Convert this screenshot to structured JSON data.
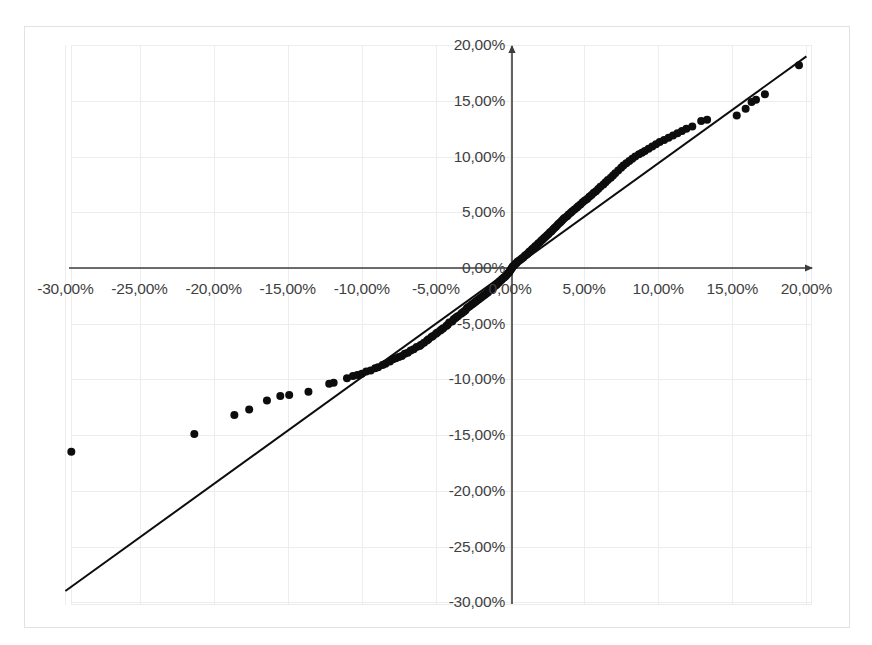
{
  "chart_data": {
    "type": "scatter",
    "title": "",
    "subtitle": "",
    "xlabel": "",
    "ylabel": "",
    "xlim": [
      -30,
      20
    ],
    "ylim": [
      -30,
      20
    ],
    "grid": true,
    "legend": null,
    "decimal_separator": ",",
    "x_tick_labels": [
      "-30,00%",
      "-25,00%",
      "-20,00%",
      "-15,00%",
      "-10,00%",
      "-5,00%",
      "0,00%",
      "5,00%",
      "10,00%",
      "15,00%",
      "20,00%"
    ],
    "x_tick_values": [
      -30,
      -25,
      -20,
      -15,
      -10,
      -5,
      0,
      5,
      10,
      15,
      20
    ],
    "y_tick_labels": [
      "20,00%",
      "15,00%",
      "10,00%",
      "5,00%",
      "0,00%",
      "-5,00%",
      "-10,00%",
      "-15,00%",
      "-20,00%",
      "-25,00%",
      "-30,00%"
    ],
    "y_tick_values": [
      20,
      15,
      10,
      5,
      0,
      -5,
      -10,
      -15,
      -20,
      -25,
      -30
    ],
    "series": [
      {
        "name": "quantile-points",
        "type": "scatter",
        "marker": "filled-circle",
        "color": "#0d0d0d",
        "marker_size": 8,
        "points": [
          [
            -29.6,
            -16.5
          ],
          [
            -21.3,
            -14.9
          ],
          [
            -18.6,
            -13.2
          ],
          [
            -17.6,
            -12.7
          ],
          [
            -16.4,
            -11.9
          ],
          [
            -15.5,
            -11.5
          ],
          [
            -14.9,
            -11.4
          ],
          [
            -13.6,
            -11.1
          ],
          [
            -12.2,
            -10.4
          ],
          [
            -11.9,
            -10.3
          ],
          [
            -11.0,
            -9.9
          ],
          [
            -10.6,
            -9.7
          ],
          [
            -10.3,
            -9.6
          ],
          [
            -10.0,
            -9.5
          ],
          [
            -9.7,
            -9.3
          ],
          [
            -9.4,
            -9.2
          ],
          [
            -9.1,
            -9.0
          ],
          [
            -8.9,
            -8.9
          ],
          [
            -8.6,
            -8.7
          ],
          [
            -8.4,
            -8.6
          ],
          [
            -8.1,
            -8.4
          ],
          [
            -7.9,
            -8.2
          ],
          [
            -7.7,
            -8.1
          ],
          [
            -7.5,
            -8.0
          ],
          [
            -7.3,
            -7.9
          ],
          [
            -7.1,
            -7.7
          ],
          [
            -6.9,
            -7.6
          ],
          [
            -6.7,
            -7.4
          ],
          [
            -6.5,
            -7.3
          ],
          [
            -6.3,
            -7.1
          ],
          [
            -6.1,
            -7.0
          ],
          [
            -6.0,
            -6.9
          ],
          [
            -5.8,
            -6.7
          ],
          [
            -5.6,
            -6.5
          ],
          [
            -5.5,
            -6.4
          ],
          [
            -5.3,
            -6.2
          ],
          [
            -5.2,
            -6.1
          ],
          [
            -5.0,
            -5.9
          ],
          [
            -4.9,
            -5.8
          ],
          [
            -4.7,
            -5.6
          ],
          [
            -4.6,
            -5.5
          ],
          [
            -4.5,
            -5.4
          ],
          [
            -4.3,
            -5.2
          ],
          [
            -4.2,
            -5.1
          ],
          [
            -4.1,
            -4.9
          ],
          [
            -3.9,
            -4.8
          ],
          [
            -3.8,
            -4.6
          ],
          [
            -3.7,
            -4.5
          ],
          [
            -3.6,
            -4.4
          ],
          [
            -3.5,
            -4.3
          ],
          [
            -3.3,
            -4.1
          ],
          [
            -3.2,
            -4.0
          ],
          [
            -3.1,
            -3.9
          ],
          [
            -3.0,
            -3.8
          ],
          [
            -2.9,
            -3.6
          ],
          [
            -2.8,
            -3.5
          ],
          [
            -2.7,
            -3.4
          ],
          [
            -2.6,
            -3.3
          ],
          [
            -2.5,
            -3.2
          ],
          [
            -2.4,
            -3.1
          ],
          [
            -2.3,
            -3.0
          ],
          [
            -2.2,
            -2.9
          ],
          [
            -2.1,
            -2.8
          ],
          [
            -2.0,
            -2.7
          ],
          [
            -1.9,
            -2.6
          ],
          [
            -1.8,
            -2.5
          ],
          [
            -1.7,
            -2.4
          ],
          [
            -1.6,
            -2.3
          ],
          [
            -1.5,
            -2.2
          ],
          [
            -1.45,
            -2.1
          ],
          [
            -1.35,
            -2.0
          ],
          [
            -1.25,
            -1.9
          ],
          [
            -1.15,
            -1.8
          ],
          [
            -1.1,
            -1.7
          ],
          [
            -1.0,
            -1.6
          ],
          [
            -0.9,
            -1.5
          ],
          [
            -0.85,
            -1.4
          ],
          [
            -0.75,
            -1.3
          ],
          [
            -0.7,
            -1.2
          ],
          [
            -0.6,
            -1.1
          ],
          [
            -0.55,
            -1.0
          ],
          [
            -0.45,
            -0.9
          ],
          [
            -0.4,
            -0.85
          ],
          [
            -0.3,
            -0.75
          ],
          [
            -0.25,
            -0.65
          ],
          [
            -0.2,
            -0.55
          ],
          [
            -0.1,
            -0.45
          ],
          [
            -0.05,
            -0.35
          ],
          [
            0.0,
            -0.25
          ],
          [
            0.05,
            -0.15
          ],
          [
            0.1,
            -0.05
          ],
          [
            0.15,
            0.05
          ],
          [
            0.2,
            0.15
          ],
          [
            0.3,
            0.25
          ],
          [
            0.35,
            0.35
          ],
          [
            0.45,
            0.45
          ],
          [
            0.5,
            0.55
          ],
          [
            0.6,
            0.65
          ],
          [
            0.7,
            0.75
          ],
          [
            0.8,
            0.85
          ],
          [
            0.9,
            0.95
          ],
          [
            1.0,
            1.1
          ],
          [
            1.1,
            1.2
          ],
          [
            1.2,
            1.3
          ],
          [
            1.3,
            1.45
          ],
          [
            1.4,
            1.55
          ],
          [
            1.5,
            1.7
          ],
          [
            1.6,
            1.8
          ],
          [
            1.7,
            1.95
          ],
          [
            1.8,
            2.05
          ],
          [
            1.9,
            2.2
          ],
          [
            2.0,
            2.3
          ],
          [
            2.1,
            2.45
          ],
          [
            2.2,
            2.55
          ],
          [
            2.3,
            2.7
          ],
          [
            2.4,
            2.8
          ],
          [
            2.5,
            2.95
          ],
          [
            2.6,
            3.05
          ],
          [
            2.7,
            3.2
          ],
          [
            2.8,
            3.3
          ],
          [
            2.9,
            3.45
          ],
          [
            3.0,
            3.6
          ],
          [
            3.1,
            3.7
          ],
          [
            3.2,
            3.85
          ],
          [
            3.3,
            4.0
          ],
          [
            3.4,
            4.1
          ],
          [
            3.5,
            4.25
          ],
          [
            3.6,
            4.4
          ],
          [
            3.7,
            4.5
          ],
          [
            3.85,
            4.65
          ],
          [
            3.95,
            4.8
          ],
          [
            4.1,
            4.95
          ],
          [
            4.2,
            5.1
          ],
          [
            4.35,
            5.25
          ],
          [
            4.5,
            5.4
          ],
          [
            4.6,
            5.55
          ],
          [
            4.75,
            5.7
          ],
          [
            4.9,
            5.9
          ],
          [
            5.05,
            6.05
          ],
          [
            5.2,
            6.2
          ],
          [
            5.35,
            6.4
          ],
          [
            5.5,
            6.55
          ],
          [
            5.65,
            6.75
          ],
          [
            5.8,
            6.9
          ],
          [
            5.95,
            7.1
          ],
          [
            6.1,
            7.3
          ],
          [
            6.3,
            7.5
          ],
          [
            6.45,
            7.7
          ],
          [
            6.6,
            7.9
          ],
          [
            6.8,
            8.1
          ],
          [
            6.95,
            8.3
          ],
          [
            7.1,
            8.5
          ],
          [
            7.3,
            8.75
          ],
          [
            7.5,
            9.0
          ],
          [
            7.65,
            9.2
          ],
          [
            7.85,
            9.4
          ],
          [
            8.05,
            9.6
          ],
          [
            8.25,
            9.8
          ],
          [
            8.45,
            10.0
          ],
          [
            8.7,
            10.2
          ],
          [
            8.9,
            10.35
          ],
          [
            9.1,
            10.5
          ],
          [
            9.35,
            10.7
          ],
          [
            9.6,
            10.9
          ],
          [
            9.85,
            11.1
          ],
          [
            10.1,
            11.3
          ],
          [
            10.4,
            11.5
          ],
          [
            10.7,
            11.7
          ],
          [
            11.0,
            11.9
          ],
          [
            11.3,
            12.1
          ],
          [
            11.6,
            12.3
          ],
          [
            11.9,
            12.5
          ],
          [
            12.3,
            12.7
          ],
          [
            12.9,
            13.2
          ],
          [
            13.3,
            13.3
          ],
          [
            15.3,
            13.7
          ],
          [
            15.9,
            14.3
          ],
          [
            16.3,
            14.9
          ],
          [
            16.6,
            15.1
          ],
          [
            17.2,
            15.6
          ],
          [
            19.5,
            18.2
          ]
        ]
      },
      {
        "name": "reference-line",
        "type": "line",
        "color": "#0d0d0d",
        "width": 2,
        "points": [
          [
            -30.0,
            -29.0
          ],
          [
            20.0,
            19.0
          ]
        ]
      }
    ]
  },
  "axes": {
    "x_axis_color": "#3c3c3c",
    "y_axis_color": "#3c3c3c",
    "arrow_x_name": "x-axis-arrow",
    "arrow_y_name": "y-axis-arrow"
  },
  "style": {
    "background": "#ffffff",
    "grid_color": "#ededed",
    "frame_color": "#e2e2e2",
    "tick_text_color": "#3f3f3f",
    "point_color": "#0d0d0d"
  }
}
